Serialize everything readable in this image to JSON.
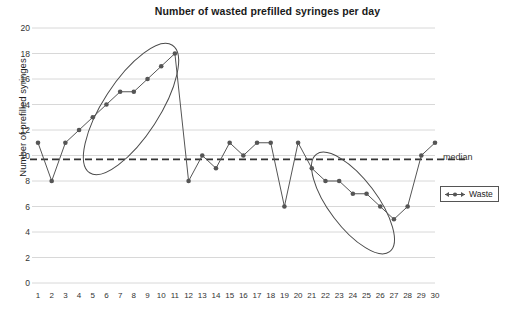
{
  "chart_data": {
    "type": "line",
    "title": "Number of wasted prefilled syringes per day",
    "xlabel": "",
    "ylabel": "Number of prefilled syringes",
    "xlim": [
      1,
      30
    ],
    "ylim": [
      0,
      20
    ],
    "grid": true,
    "legend_position": "right",
    "x": [
      1,
      2,
      3,
      4,
      5,
      6,
      7,
      8,
      9,
      10,
      11,
      12,
      13,
      14,
      15,
      16,
      17,
      18,
      19,
      20,
      21,
      22,
      23,
      24,
      25,
      26,
      27,
      28,
      29,
      30
    ],
    "categories": [
      "1",
      "2",
      "3",
      "4",
      "5",
      "6",
      "7",
      "8",
      "9",
      "10",
      "11",
      "12",
      "13",
      "14",
      "15",
      "16",
      "17",
      "18",
      "19",
      "20",
      "21",
      "22",
      "23",
      "24",
      "25",
      "26",
      "27",
      "28",
      "29",
      "30"
    ],
    "y_ticks": [
      0,
      2,
      4,
      6,
      8,
      10,
      12,
      14,
      16,
      18,
      20
    ],
    "series": [
      {
        "name": "Waste",
        "values": [
          11,
          8,
          11,
          12,
          13,
          14,
          15,
          15,
          16,
          17,
          18,
          8,
          10,
          9,
          11,
          10,
          11,
          11,
          6,
          11,
          9,
          8,
          8,
          7,
          7,
          6,
          5,
          6,
          10,
          11
        ],
        "color": "#555555",
        "marker": "circle"
      }
    ],
    "reference_lines": [
      {
        "name": "median",
        "label": "median",
        "value": 9.7,
        "style": "dashed",
        "color": "#333333"
      }
    ],
    "annotations": [
      {
        "name": "rising-trend-ellipse",
        "shape": "ellipse",
        "label": "",
        "covers_days": [
          3,
          11
        ],
        "cx": 131,
        "cy": 109,
        "rx": 76,
        "ry": 28,
        "rotation": -57
      },
      {
        "name": "falling-trend-ellipse",
        "shape": "ellipse",
        "label": "",
        "covers_days": [
          20,
          27
        ],
        "cx": 353,
        "cy": 203,
        "rx": 61,
        "ry": 24,
        "rotation": 53
      }
    ]
  },
  "legend": {
    "entries": [
      {
        "label": "Waste",
        "color": "#555555"
      }
    ]
  },
  "median_marker": {
    "label": "median"
  }
}
